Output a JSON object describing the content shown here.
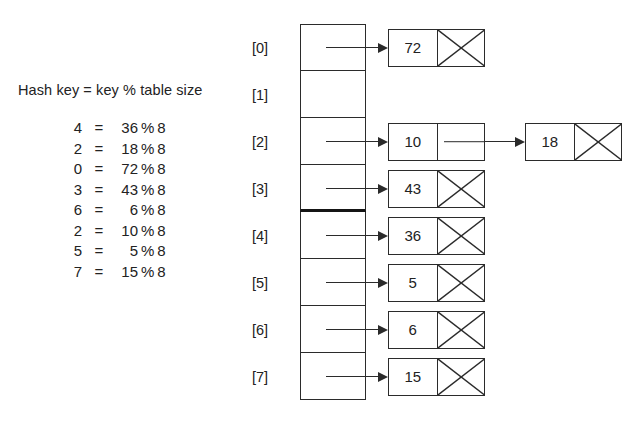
{
  "diagram": {
    "title": "Hash key = key % table size",
    "table_size": 8,
    "modulus": 8,
    "equations": [
      {
        "key": "4",
        "eq": "=",
        "dividend": "36",
        "op": "%",
        "divisor": "8"
      },
      {
        "key": "2",
        "eq": "=",
        "dividend": "18",
        "op": "%",
        "divisor": "8"
      },
      {
        "key": "0",
        "eq": "=",
        "dividend": "72",
        "op": "%",
        "divisor": "8"
      },
      {
        "key": "3",
        "eq": "=",
        "dividend": "43",
        "op": "%",
        "divisor": "8"
      },
      {
        "key": "6",
        "eq": "=",
        "dividend": "6",
        "op": "%",
        "divisor": "8"
      },
      {
        "key": "2",
        "eq": "=",
        "dividend": "10",
        "op": "%",
        "divisor": "8"
      },
      {
        "key": "5",
        "eq": "=",
        "dividend": "5",
        "op": "%",
        "divisor": "8"
      },
      {
        "key": "7",
        "eq": "=",
        "dividend": "15",
        "op": "%",
        "divisor": "8"
      }
    ],
    "buckets": [
      {
        "index_label": "[0]",
        "index": 0,
        "chain": [
          "72"
        ]
      },
      {
        "index_label": "[1]",
        "index": 1,
        "chain": []
      },
      {
        "index_label": "[2]",
        "index": 2,
        "chain": [
          "10",
          "18"
        ]
      },
      {
        "index_label": "[3]",
        "index": 3,
        "chain": [
          "43"
        ]
      },
      {
        "index_label": "[4]",
        "index": 4,
        "chain": [
          "36"
        ]
      },
      {
        "index_label": "[5]",
        "index": 5,
        "chain": [
          "5"
        ]
      },
      {
        "index_label": "[6]",
        "index": 6,
        "chain": [
          "6"
        ]
      },
      {
        "index_label": "[7]",
        "index": 7,
        "chain": [
          "15"
        ]
      }
    ],
    "colors": {
      "ink": "#2b2b2b",
      "background": "#ffffff",
      "text": "#222222"
    }
  }
}
